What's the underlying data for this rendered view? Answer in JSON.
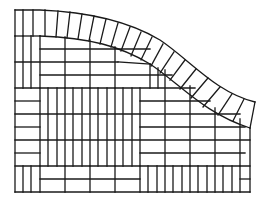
{
  "diagram": {
    "title": "",
    "stroke_color": "#1a1a1a",
    "background": "#ffffff",
    "elements": [
      "curved-border-band",
      "basketweave-field",
      "stack-bond-panels"
    ]
  }
}
